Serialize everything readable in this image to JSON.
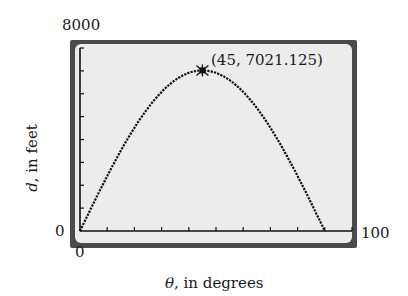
{
  "chart_data": {
    "type": "line",
    "title": "",
    "xlabel_var": "θ",
    "xlabel_rest": ", in degrees",
    "ylabel_var": "d",
    "ylabel_rest": ", in feet",
    "xlim": [
      0,
      100
    ],
    "ylim": [
      0,
      8000
    ],
    "x_tick_step": 10,
    "y_tick_step": 1000,
    "tick_labels": {
      "x_min": "0",
      "x_max": "100",
      "y_min": "0",
      "y_max": "8000"
    },
    "grid": false,
    "legend": null,
    "function": "d = 7021.125 · sin(2θ)",
    "series": [
      {
        "name": "d(θ)",
        "x": [
          0,
          5,
          10,
          15,
          20,
          25,
          30,
          35,
          40,
          45,
          50,
          55,
          60,
          65,
          70,
          75,
          80,
          85,
          90
        ],
        "values": [
          0,
          1219,
          2401,
          3511,
          4513,
          5379,
          6080,
          6598,
          6914,
          7021,
          6914,
          6598,
          6080,
          5379,
          4513,
          3511,
          2401,
          1219,
          0
        ]
      }
    ],
    "annotations": [
      {
        "x": 45,
        "y": 7021.125,
        "text": "(45, 7021.125)",
        "marker": "star"
      }
    ]
  },
  "colors": {
    "frame": "#4a4a4a",
    "plot_bg": "#ececec",
    "curve": "#111111",
    "axis": "#111111"
  }
}
